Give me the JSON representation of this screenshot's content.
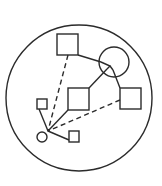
{
  "diagram": {
    "stroke_color": "#2b2b2b",
    "background": "#ffffff",
    "outer_circle": {
      "cx": 79,
      "cy": 98,
      "r": 73
    },
    "nodes": [
      {
        "id": "top-square",
        "shape": "square",
        "x": 57,
        "y": 34,
        "w": 21,
        "h": 21
      },
      {
        "id": "medium-circle",
        "shape": "circle",
        "cx": 114,
        "cy": 62,
        "r": 15
      },
      {
        "id": "middle-square",
        "shape": "square",
        "x": 68,
        "y": 88,
        "w": 21,
        "h": 22
      },
      {
        "id": "right-square",
        "shape": "square",
        "x": 120,
        "y": 88,
        "w": 21,
        "h": 21
      },
      {
        "id": "small-square-left",
        "shape": "square",
        "x": 37,
        "y": 99,
        "w": 10,
        "h": 10
      },
      {
        "id": "small-square-bottom",
        "shape": "square",
        "x": 69,
        "y": 131,
        "w": 10,
        "h": 11
      },
      {
        "id": "small-circle",
        "shape": "circle",
        "cx": 42,
        "cy": 137,
        "r": 5
      }
    ],
    "hub": {
      "x": 48,
      "y": 131
    },
    "junction": {
      "x": 109,
      "y": 67
    },
    "edges": [
      {
        "from": "top-square",
        "to": "hub",
        "style": "dashed",
        "x1": 68,
        "y1": 55,
        "x2": 48,
        "y2": 131
      },
      {
        "from": "right-square",
        "to": "hub",
        "style": "dashed",
        "x1": 120,
        "y1": 100,
        "x2": 48,
        "y2": 131
      },
      {
        "from": "middle-square",
        "to": "hub",
        "style": "solid",
        "x1": 68,
        "y1": 110,
        "x2": 48,
        "y2": 131
      },
      {
        "from": "small-square-left",
        "to": "hub",
        "style": "solid",
        "x1": 39,
        "y1": 109,
        "x2": 48,
        "y2": 131
      },
      {
        "from": "hub",
        "to": "small-square-bottom",
        "style": "solid",
        "x1": 48,
        "y1": 131,
        "x2": 69,
        "y2": 140
      },
      {
        "from": "top-square",
        "to": "junction",
        "style": "solid",
        "x1": 78,
        "y1": 55,
        "x2": 101,
        "y2": 62
      },
      {
        "from": "middle-square",
        "to": "junction",
        "style": "solid",
        "x1": 89,
        "y1": 88,
        "x2": 107,
        "y2": 69
      },
      {
        "from": "junction",
        "to": "right-square",
        "style": "solid",
        "x1": 113,
        "y1": 70,
        "x2": 120,
        "y2": 88
      }
    ],
    "junction_triangle": "101,62 110,66 107,69 113,70"
  }
}
